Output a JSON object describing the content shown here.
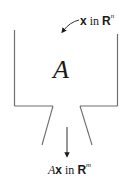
{
  "diagram": {
    "input": {
      "vector": "x",
      "connector": "in",
      "space": "R",
      "dim": "n"
    },
    "machine": {
      "label": "A"
    },
    "output": {
      "prefix": "A",
      "vector": "x",
      "connector": "in",
      "space": "R",
      "dim": "m"
    },
    "colors": {
      "line": "#6e6e6e",
      "text": "#1a1a1a",
      "background": "#ffffff"
    }
  }
}
